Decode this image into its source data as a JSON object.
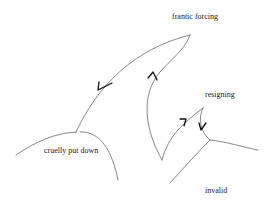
{
  "diagram": {
    "type": "hand-drawn state landscape diagram",
    "stroke_color": "#555555",
    "arrow_color": "#111111",
    "labels": {
      "frantic_forcing": "frantic forcing",
      "cruelly_put_down": "cruelly put down",
      "resigning": "resigning",
      "invalid": "invalid"
    },
    "nodes": [
      {
        "id": "frantic_forcing",
        "label": "frantic forcing",
        "approx_xy": [
          190,
          35
        ]
      },
      {
        "id": "cruelly_put_down",
        "label": "cruelly put down",
        "approx_xy": [
          76,
          132
        ]
      },
      {
        "id": "resigning",
        "label": "resigning",
        "approx_xy": [
          203,
          108
        ]
      },
      {
        "id": "invalid",
        "label": "invalid",
        "approx_xy": [
          170,
          183
        ]
      }
    ],
    "edges": [
      {
        "from": "frantic_forcing",
        "to": "cruelly_put_down",
        "arrow_direction": "down-left"
      },
      {
        "from": "invalid_lower_left_cusp",
        "to": "frantic_forcing",
        "arrow_direction": "up"
      },
      {
        "from": "lower_cusp",
        "to": "resigning",
        "arrow_direction": "up-right"
      },
      {
        "from": "resigning",
        "to": "junction",
        "arrow_direction": "down"
      }
    ]
  }
}
